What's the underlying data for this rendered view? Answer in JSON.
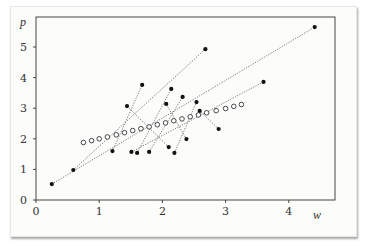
{
  "chart_data": {
    "type": "scatter",
    "title": "",
    "xlabel": "w",
    "ylabel": "p",
    "xlim": [
      0,
      4.9
    ],
    "ylim": [
      0,
      5.9
    ],
    "xticks": [
      0,
      1,
      2,
      3,
      4
    ],
    "yticks": [
      0,
      1,
      2,
      3,
      4,
      5
    ],
    "grid": false,
    "legend": null,
    "series": [
      {
        "name": "filled-lower",
        "marker": "filled-circle",
        "points": [
          [
            0.25,
            0.52
          ],
          [
            0.59,
            0.98
          ],
          [
            1.21,
            1.6
          ],
          [
            1.51,
            1.57
          ],
          [
            1.6,
            1.54
          ],
          [
            1.79,
            1.57
          ],
          [
            2.1,
            1.73
          ],
          [
            2.19,
            1.54
          ],
          [
            2.38,
            1.99
          ],
          [
            2.89,
            2.32
          ]
        ]
      },
      {
        "name": "filled-upper",
        "marker": "filled-circle",
        "points": [
          [
            4.41,
            5.65
          ],
          [
            2.68,
            4.93
          ],
          [
            1.68,
            3.76
          ],
          [
            3.6,
            3.86
          ],
          [
            2.14,
            3.63
          ],
          [
            2.32,
            3.37
          ],
          [
            1.44,
            3.07
          ],
          [
            2.06,
            3.14
          ],
          [
            2.54,
            3.2
          ],
          [
            2.59,
            2.91
          ]
        ]
      },
      {
        "name": "hollow-midpoints",
        "marker": "hollow-circle",
        "points": [
          [
            0.75,
            1.88
          ],
          [
            0.88,
            1.94
          ],
          [
            1.0,
            2.0
          ],
          [
            1.13,
            2.06
          ],
          [
            1.27,
            2.13
          ],
          [
            1.4,
            2.2
          ],
          [
            1.53,
            2.27
          ],
          [
            1.66,
            2.33
          ],
          [
            1.79,
            2.39
          ],
          [
            1.92,
            2.46
          ],
          [
            2.05,
            2.52
          ],
          [
            2.18,
            2.59
          ],
          [
            2.31,
            2.65
          ],
          [
            2.44,
            2.72
          ],
          [
            2.57,
            2.78
          ],
          [
            2.7,
            2.85
          ],
          [
            2.85,
            2.92
          ],
          [
            3.0,
            2.99
          ],
          [
            3.13,
            3.06
          ],
          [
            3.25,
            3.12
          ]
        ]
      }
    ],
    "segments": [
      [
        [
          0.25,
          0.52
        ],
        [
          4.41,
          5.65
        ]
      ],
      [
        [
          0.59,
          0.98
        ],
        [
          2.68,
          4.93
        ]
      ],
      [
        [
          1.21,
          1.6
        ],
        [
          1.68,
          3.76
        ]
      ],
      [
        [
          1.51,
          1.57
        ],
        [
          3.6,
          3.86
        ]
      ],
      [
        [
          1.6,
          1.54
        ],
        [
          2.14,
          3.63
        ]
      ],
      [
        [
          1.79,
          1.57
        ],
        [
          2.32,
          3.37
        ]
      ],
      [
        [
          2.1,
          1.73
        ],
        [
          1.44,
          3.07
        ]
      ],
      [
        [
          2.19,
          1.54
        ],
        [
          2.54,
          3.2
        ]
      ],
      [
        [
          2.38,
          1.99
        ],
        [
          2.06,
          3.14
        ]
      ],
      [
        [
          2.89,
          2.32
        ],
        [
          2.59,
          2.91
        ]
      ]
    ],
    "segment_style": "dotted"
  },
  "axes": {
    "x_label": "w",
    "y_label": "p",
    "x_tick_labels": [
      "0",
      "1",
      "2",
      "3",
      "4"
    ],
    "y_tick_labels": [
      "0",
      "1",
      "2",
      "3",
      "4",
      "5"
    ]
  }
}
